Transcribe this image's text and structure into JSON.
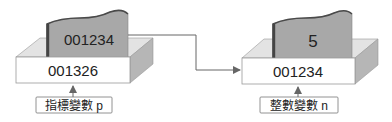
{
  "diagram": {
    "type": "pointer-memory-diagram",
    "colors": {
      "card_fill": "#a9a9a9",
      "card_edge": "#555555",
      "box_front": "#ffffff",
      "box_side": "#b8b8b8",
      "box_top": "#e6e6e6",
      "line": "#666666",
      "text": "#222222"
    },
    "left": {
      "card_value": "001234",
      "box_address": "001326",
      "label": "指標變數 p"
    },
    "right": {
      "card_value": "5",
      "box_address": "001234",
      "label": "整數變數 n"
    },
    "connector": {
      "from": "left.card_value",
      "to": "right.box_address",
      "meaning": "p points to n"
    }
  }
}
